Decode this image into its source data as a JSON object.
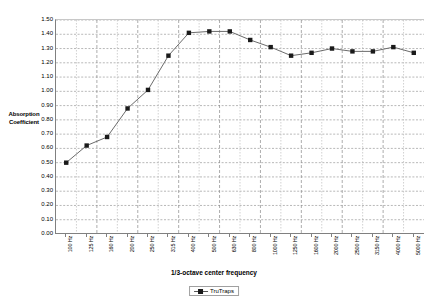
{
  "chart_data": {
    "type": "line",
    "title": "",
    "xlabel": "1/3-octave center frequency",
    "ylabel": "Absorption Coefficient",
    "ylim": [
      0.0,
      1.5
    ],
    "ytick_step": 0.1,
    "grid": true,
    "legend_position": "bottom",
    "legend": [
      "TruTraps"
    ],
    "marker": "square",
    "line_color": "#6b6b6b",
    "marker_color": "#1a1a1a",
    "categories": [
      "100 Hz",
      "125 Hz",
      "160 Hz",
      "200 Hz",
      "250 Hz",
      "315 Hz",
      "400 Hz",
      "500 Hz",
      "630 Hz",
      "800 Hz",
      "1000 Hz",
      "1250 Hz",
      "1600 Hz",
      "2000 Hz",
      "2500 Hz",
      "3150 Hz",
      "4000 Hz",
      "5000 Hz"
    ],
    "ytick_labels": [
      "1.50",
      "1.40",
      "1.30",
      "1.20",
      "1.10",
      "1.00",
      "0.90",
      "0.80",
      "0.70",
      "0.60",
      "0.50",
      "0.40",
      "0.30",
      "0.20",
      "0.10",
      "0.00"
    ],
    "series": [
      {
        "name": "TruTraps",
        "values": [
          0.5,
          0.62,
          0.68,
          0.88,
          1.01,
          1.25,
          1.41,
          1.42,
          1.42,
          1.36,
          1.31,
          1.25,
          1.27,
          1.3,
          1.28,
          1.28,
          1.31,
          1.27
        ]
      }
    ]
  },
  "legend": {
    "entry_label": "TruTraps"
  },
  "axes": {
    "y_title_line1": "Absorption",
    "y_title_line2": "Coefficient",
    "x_title": "1/3-octave center frequency"
  }
}
